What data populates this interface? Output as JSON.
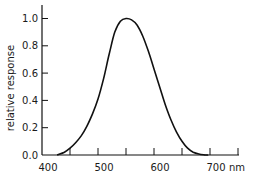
{
  "chart_data": {
    "type": "line",
    "title": "",
    "xlabel": "nm",
    "ylabel": "relative response",
    "xlim": [
      400,
      750
    ],
    "ylim": [
      0.0,
      1.05
    ],
    "x_tick_labels": [
      "400",
      "500",
      "600",
      "700"
    ],
    "x_ticks": [
      400,
      450,
      500,
      550,
      600,
      650,
      700,
      750
    ],
    "y_tick_labels": [
      "0.0",
      "0.2",
      "0.4",
      "0.6",
      "0.8",
      "1.0"
    ],
    "y_ticks": [
      0.0,
      0.2,
      0.4,
      0.6,
      0.8,
      1.0
    ],
    "grid": false,
    "legend": null,
    "series": [
      {
        "name": "relative response",
        "x": [
          427,
          440,
          450,
          460,
          470,
          480,
          490,
          500,
          510,
          520,
          530,
          540,
          550,
          560,
          570,
          580,
          590,
          600,
          610,
          620,
          630,
          640,
          650,
          660,
          670,
          680,
          690,
          697
        ],
        "y": [
          0.0,
          0.02,
          0.05,
          0.09,
          0.14,
          0.21,
          0.3,
          0.41,
          0.56,
          0.74,
          0.9,
          0.98,
          1.0,
          0.99,
          0.95,
          0.87,
          0.76,
          0.63,
          0.5,
          0.37,
          0.26,
          0.17,
          0.1,
          0.05,
          0.02,
          0.007,
          0.001,
          0.0
        ]
      }
    ]
  },
  "axis": {
    "x_unit": "nm",
    "y_title": "relative response"
  }
}
